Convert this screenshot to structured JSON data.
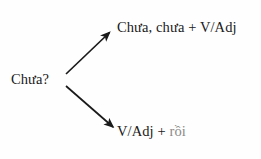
{
  "diagram": {
    "type": "branching-tree",
    "background_color": "#fefefe",
    "text_color": "#1a1a1a",
    "muted_text_color": "#8a8a88",
    "root": {
      "label": "Chưa?",
      "name": "root-node"
    },
    "branches": [
      {
        "name": "branch-top",
        "label": "Chưa, chưa + V/Adj",
        "arrow": {
          "name": "arrow-up-right-icon",
          "direction": "up-right",
          "from": [
            66,
            74
          ],
          "to": [
            112,
            30
          ]
        }
      },
      {
        "name": "branch-bottom",
        "label_prefix": "V/Adj + ",
        "label_muted": "rồi",
        "label_full": "V/Adj + rồi",
        "arrow": {
          "name": "arrow-down-right-icon",
          "direction": "down-right",
          "from": [
            66,
            86
          ],
          "to": [
            116,
            130
          ]
        }
      }
    ]
  }
}
